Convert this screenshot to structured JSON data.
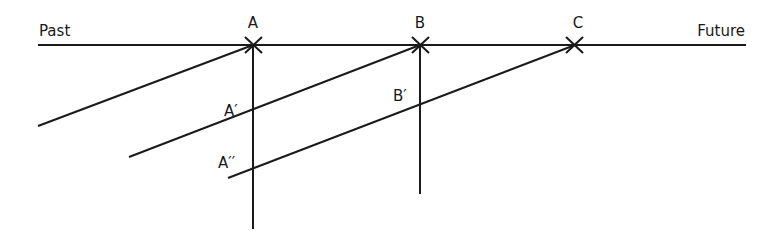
{
  "diagram": {
    "type": "timeline-diagram",
    "axis": {
      "left_label": "Past",
      "right_label": "Future"
    },
    "points": [
      {
        "id": "A",
        "label": "A"
      },
      {
        "id": "B",
        "label": "B"
      },
      {
        "id": "C",
        "label": "C"
      }
    ],
    "projections": [
      {
        "id": "A1",
        "label": "A′"
      },
      {
        "id": "A2",
        "label": "A′′"
      },
      {
        "id": "B1",
        "label": "B′"
      }
    ],
    "colors": {
      "line": "#1a1a1a",
      "background": "#ffffff"
    }
  }
}
